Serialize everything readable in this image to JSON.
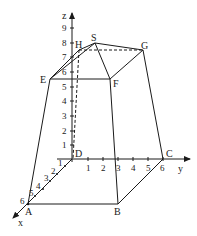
{
  "diagram": {
    "type": "3d-coordinate-solid",
    "axes": {
      "x": {
        "label": "x",
        "ticks": [
          "1",
          "2",
          "3",
          "4",
          "5",
          "6"
        ]
      },
      "y": {
        "label": "y",
        "ticks": [
          "1",
          "2",
          "3",
          "4",
          "5",
          "6"
        ]
      },
      "z": {
        "label": "z",
        "ticks": [
          "1",
          "2",
          "3",
          "4",
          "5",
          "6",
          "7",
          "8",
          "9"
        ]
      }
    },
    "points": {
      "A": "A",
      "B": "B",
      "C": "C",
      "D": "D",
      "E": "E",
      "F": "F",
      "G": "G",
      "H": "H",
      "S": "S"
    },
    "colors": {
      "line": "#1a1a1a",
      "background": "#ffffff"
    }
  }
}
